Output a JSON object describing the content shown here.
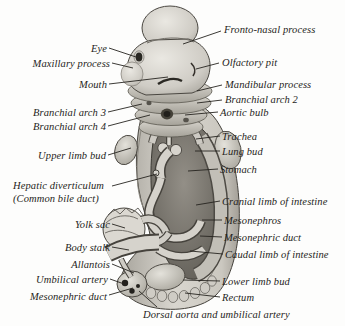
{
  "figure": {
    "background_color": "#fdfdfc",
    "label_color": "#1f1e1b",
    "line_color": "#26241f",
    "labels_left": [
      {
        "text": "Eye"
      },
      {
        "text": "Maxillary process"
      },
      {
        "text": "Mouth"
      },
      {
        "text": "Branchial arch 3"
      },
      {
        "text": "Branchial arch 4"
      },
      {
        "text": "Upper limb bud"
      },
      {
        "line1": "Hepatic diverticulum",
        "line2": "(Common bile duct)"
      },
      {
        "text": "Yolk sac"
      },
      {
        "text": "Body stalk"
      },
      {
        "text": "Allantois"
      },
      {
        "text": "Umbilical artery"
      },
      {
        "text": "Mesonephric duct"
      }
    ],
    "labels_right": [
      {
        "text": "Fronto-nasal process"
      },
      {
        "text": "Olfactory pit"
      },
      {
        "text": "Mandibular process"
      },
      {
        "text": "Branchial arch 2"
      },
      {
        "text": "Aortic bulb"
      },
      {
        "text": "Trachea"
      },
      {
        "text": "Lung bud"
      },
      {
        "text": "Stomach"
      },
      {
        "text": "Cranial limb of intestine"
      },
      {
        "text": "Mesonephros"
      },
      {
        "text": "Mesonephric duct"
      },
      {
        "text": "Caudal limb of intestine"
      },
      {
        "text": "Lower limb bud"
      },
      {
        "text": "Rectum"
      }
    ],
    "caption_bottom": "Dorsal aorta and umbilical artery"
  }
}
